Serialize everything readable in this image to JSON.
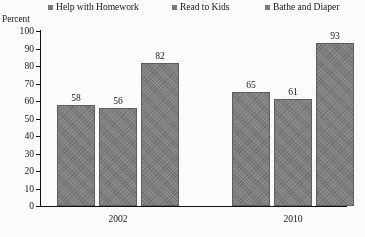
{
  "chart_data": {
    "type": "bar",
    "title": "",
    "subtitle": "",
    "xlabel": "",
    "ylabel": "Percent",
    "ylim": [
      0,
      100
    ],
    "ytick_step": 10,
    "yticks": [
      "100",
      "90",
      "80",
      "70",
      "60",
      "50",
      "40",
      "30",
      "20",
      "10",
      "0"
    ],
    "grid": false,
    "legend_position": "top",
    "categories": [
      "2002",
      "2010"
    ],
    "series": [
      {
        "name": "Help with Homework",
        "values": [
          58,
          65
        ],
        "color": "#7b7b7b",
        "marker": "square"
      },
      {
        "name": "Read to Kids",
        "values": [
          56,
          61
        ],
        "color": "#7b7b7b",
        "marker": "square"
      },
      {
        "name": "Bathe and Diaper",
        "values": [
          82,
          93
        ],
        "color": "#7b7b7b",
        "marker": "square"
      }
    ],
    "data_labels": [
      "58",
      "56",
      "82",
      "65",
      "61",
      "93"
    ],
    "annotations": []
  },
  "legend": {
    "items": [
      {
        "label": "Help with Homework"
      },
      {
        "label": "Read to Kids"
      },
      {
        "label": "Bathe and Diaper"
      }
    ]
  },
  "axis": {
    "y_title": "Percent"
  },
  "colors": {
    "bar_fill": "#7b7b7b",
    "bar_stroke": "#5f5f5f",
    "axis": "#111111",
    "text": "#1a1a1a",
    "background": "#ffffff"
  }
}
